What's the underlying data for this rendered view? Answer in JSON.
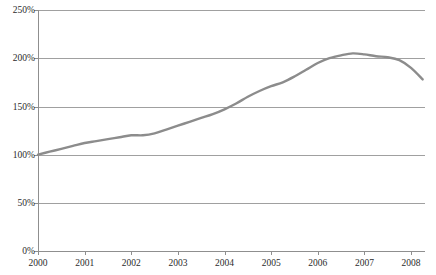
{
  "chart_data": {
    "type": "line",
    "title": "",
    "subtitle": "",
    "xlabel": "",
    "ylabel": "",
    "grid": true,
    "legend": false,
    "legend_position": "none",
    "line_color": "#8c8c8c",
    "line_width": 2.4,
    "axis_color": "#9a9a9a",
    "background": "#ffffff",
    "xlim": [
      2000,
      2008.3
    ],
    "ylim": [
      0,
      250
    ],
    "y_ticks": [
      0,
      50,
      100,
      150,
      200,
      250
    ],
    "y_tick_labels": [
      "0%",
      "50%",
      "100%",
      "150%",
      "200%",
      "250%"
    ],
    "x_ticks": [
      2000,
      2001,
      2002,
      2003,
      2004,
      2005,
      2006,
      2007,
      2008
    ],
    "x_tick_labels": [
      "2000",
      "2001",
      "2002",
      "2003",
      "2004",
      "2005",
      "2006",
      "2007",
      "2008"
    ],
    "series": [
      {
        "name": "index",
        "x": [
          2000.0,
          2000.25,
          2000.5,
          2000.75,
          2001.0,
          2001.25,
          2001.5,
          2001.75,
          2002.0,
          2002.25,
          2002.5,
          2002.75,
          2003.0,
          2003.25,
          2003.5,
          2003.75,
          2004.0,
          2004.25,
          2004.5,
          2004.75,
          2005.0,
          2005.25,
          2005.5,
          2005.75,
          2006.0,
          2006.25,
          2006.5,
          2006.75,
          2007.0,
          2007.25,
          2007.5,
          2007.75,
          2008.0,
          2008.25
        ],
        "values": [
          100,
          103,
          106,
          109,
          112,
          114,
          116,
          118,
          120,
          120,
          122,
          126,
          130,
          134,
          138,
          142,
          147,
          153,
          160,
          166,
          171,
          175,
          181,
          188,
          195,
          200,
          203,
          205,
          204,
          202,
          201,
          198,
          190,
          178
        ]
      }
    ],
    "annotations": []
  }
}
